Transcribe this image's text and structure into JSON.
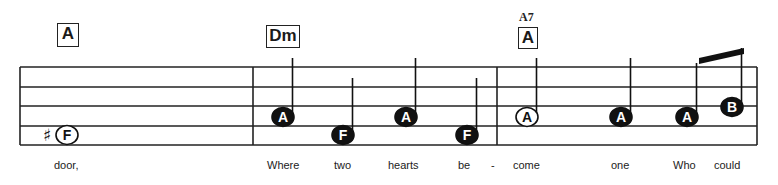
{
  "staff": {
    "left": 20,
    "right": 757,
    "lines_y": [
      67,
      87,
      106,
      126,
      145
    ],
    "barlines_x": [
      20,
      253,
      497,
      757
    ],
    "color": "#222222"
  },
  "chords": [
    {
      "name": "A",
      "x": 57,
      "y": 23,
      "w": 22,
      "h": 24
    },
    {
      "name": "Dm",
      "x": 266,
      "y": 25,
      "w": 34,
      "h": 23
    },
    {
      "name": "A",
      "alt": "A7",
      "x": 518,
      "y": 27,
      "w": 20,
      "h": 22
    }
  ],
  "notes": [
    {
      "letter": "F",
      "x": 67,
      "y": 135,
      "filled": false,
      "stem": false,
      "accidental": "♯",
      "duration": "whole"
    },
    {
      "letter": "A",
      "x": 283,
      "y": 117,
      "filled": true,
      "stem_top": 58,
      "duration": "quarter"
    },
    {
      "letter": "F",
      "x": 343,
      "y": 135,
      "filled": true,
      "stem_top": 78,
      "duration": "quarter"
    },
    {
      "letter": "A",
      "x": 406,
      "y": 117,
      "filled": true,
      "stem_top": 58,
      "duration": "quarter"
    },
    {
      "letter": "F",
      "x": 467,
      "y": 135,
      "filled": true,
      "stem_top": 78,
      "duration": "quarter"
    },
    {
      "letter": "A",
      "x": 527,
      "y": 117,
      "filled": false,
      "stem_top": 58,
      "duration": "half"
    },
    {
      "letter": "A",
      "x": 621,
      "y": 117,
      "filled": true,
      "stem_top": 58,
      "duration": "quarter"
    },
    {
      "letter": "A",
      "x": 687,
      "y": 117,
      "filled": true,
      "stem_top": 63,
      "duration": "eighth"
    },
    {
      "letter": "B",
      "x": 732,
      "y": 107,
      "filled": true,
      "stem_top": 48,
      "duration": "eighth"
    }
  ],
  "beam": {
    "x1": 699,
    "y1": 58,
    "x2": 744,
    "y2": 48,
    "thickness": 6
  },
  "lyrics": [
    {
      "text": "door,",
      "x": 54
    },
    {
      "text": "Where",
      "x": 267
    },
    {
      "text": "two",
      "x": 334
    },
    {
      "text": "hearts",
      "x": 388
    },
    {
      "text": "be",
      "x": 458
    },
    {
      "text": "-",
      "x": 491
    },
    {
      "text": "come",
      "x": 513
    },
    {
      "text": "one",
      "x": 611
    },
    {
      "text": "Who",
      "x": 673
    },
    {
      "text": "could",
      "x": 714
    }
  ]
}
